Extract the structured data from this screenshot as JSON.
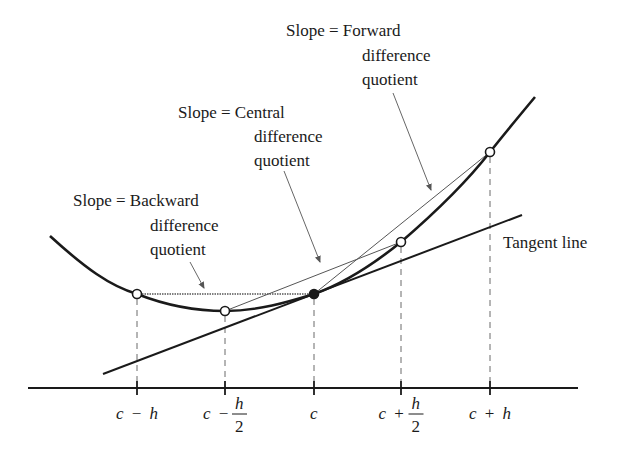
{
  "figure": {
    "type": "finite-difference-slope-diagram",
    "colors": {
      "ink": "#1a1a1a",
      "secant": "#555555",
      "guide": "#6a6a6a",
      "background": "#ffffff"
    }
  },
  "labels": {
    "forward": {
      "line1": "Slope = Forward",
      "line2": "difference",
      "line3": "quotient"
    },
    "central": {
      "line1": "Slope = Central",
      "line2": "difference",
      "line3": "quotient"
    },
    "backward": {
      "line1": "Slope = Backward",
      "line2": "difference",
      "line3": "quotient"
    },
    "tangent": "Tangent line"
  },
  "axis": {
    "ticks": [
      {
        "id": "c-minus-h",
        "label": "c − h",
        "var": "c",
        "op": "−",
        "term": "h",
        "fraction": false
      },
      {
        "id": "c-minus-half-h",
        "label": "c − h/2",
        "var": "c",
        "op": "−",
        "num": "h",
        "den": "2",
        "fraction": true
      },
      {
        "id": "c",
        "label": "c",
        "var": "c",
        "fraction": false
      },
      {
        "id": "c-plus-half-h",
        "label": "c + h/2",
        "var": "c",
        "op": "+",
        "num": "h",
        "den": "2",
        "fraction": true
      },
      {
        "id": "c-plus-h",
        "label": "c + h",
        "var": "c",
        "op": "+",
        "term": "h",
        "fraction": false
      }
    ]
  },
  "points": [
    {
      "id": "p-c-minus-h",
      "style": "open"
    },
    {
      "id": "p-c-minus-half-h",
      "style": "open"
    },
    {
      "id": "p-c",
      "style": "filled"
    },
    {
      "id": "p-c-plus-half-h",
      "style": "open"
    },
    {
      "id": "p-c-plus-h",
      "style": "open"
    }
  ]
}
